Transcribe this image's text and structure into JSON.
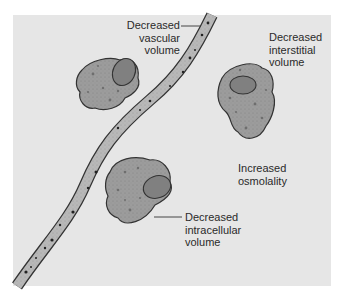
{
  "diagram": {
    "title": "",
    "background_color": "#e6e6e6",
    "cell_fill": "#9a9a9a",
    "nucleus_fill": "#808080",
    "vessel_fill": "#b5b5b5",
    "outline_color": "#333333",
    "labels": {
      "vascular": "Decreased\nvascular\nvolume",
      "vascular_lines": [
        "Decreased",
        "vascular",
        "volume"
      ],
      "interstitial_lines": [
        "Decreased",
        "interstitial",
        "volume"
      ],
      "osmolality_lines": [
        "Increased",
        "osmolality"
      ],
      "intracellular_lines": [
        "Decreased",
        "intracellular",
        "volume"
      ]
    },
    "elements": [
      "blood-vessel",
      "cell-upper-left",
      "cell-right",
      "cell-lower-center"
    ]
  }
}
